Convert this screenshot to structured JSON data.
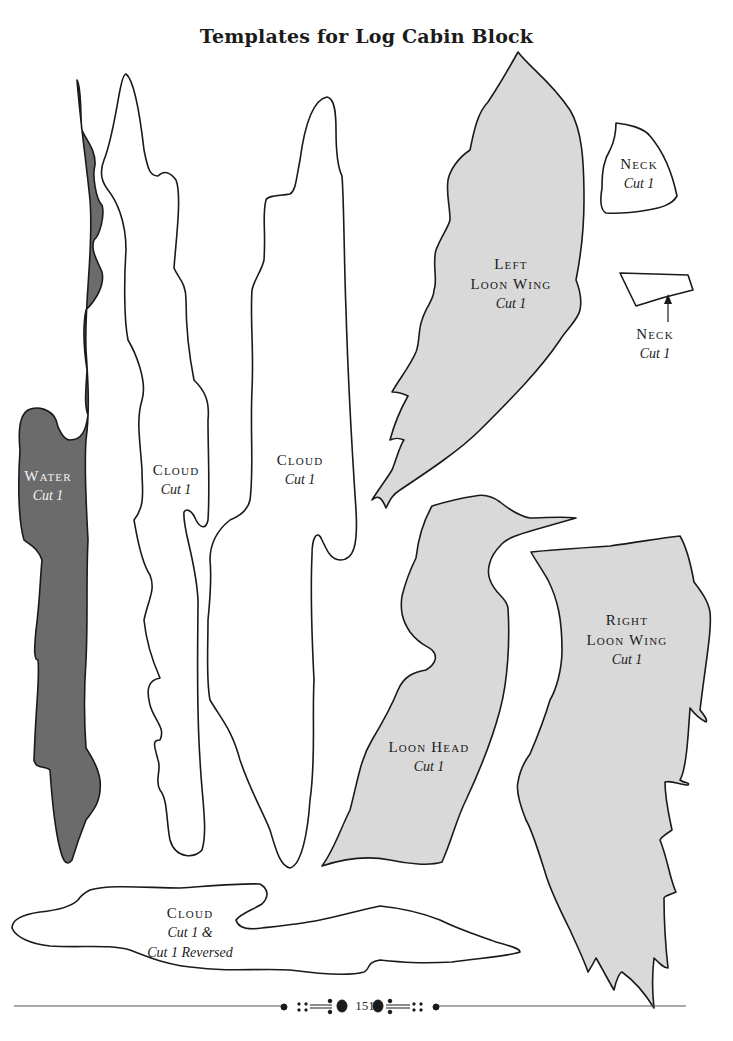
{
  "page": {
    "title": "Templates for Log Cabin Block",
    "page_number": "151"
  },
  "colors": {
    "water_fill": "#6b6b6b",
    "loon_fill": "#d9d9d9",
    "cloud_fill": "#ffffff",
    "outline": "#1a1a1a"
  },
  "templates": [
    {
      "name": "Water",
      "cut": "Cut 1",
      "fill": "dark gray"
    },
    {
      "name": "Cloud",
      "cut": "Cut 1",
      "fill": "white"
    },
    {
      "name": "Cloud",
      "cut": "Cut 1",
      "fill": "white"
    },
    {
      "name": "Left Loon Wing",
      "name_line1": "Left",
      "name_line2": "Loon Wing",
      "cut": "Cut 1",
      "fill": "light gray"
    },
    {
      "name": "Neck",
      "cut": "Cut 1",
      "fill": "white"
    },
    {
      "name": "Neck",
      "cut": "Cut 1",
      "fill": "white"
    },
    {
      "name": "Loon Head",
      "cut": "Cut 1",
      "fill": "light gray"
    },
    {
      "name": "Right Loon Wing",
      "name_line1": "Right",
      "name_line2": "Loon Wing",
      "cut": "Cut 1",
      "fill": "light gray"
    },
    {
      "name": "Cloud",
      "cut": "Cut 1 &",
      "cut_line2": "Cut 1 Reversed",
      "fill": "white"
    }
  ]
}
